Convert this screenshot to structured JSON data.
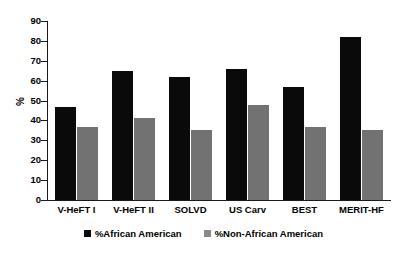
{
  "chart_data": {
    "type": "bar",
    "title": "",
    "subtitle": "",
    "xlabel": "",
    "ylabel": "%",
    "ylim": [
      0,
      90
    ],
    "ytick_step": 10,
    "yticks": [
      "90",
      "80",
      "70",
      "60",
      "50",
      "40",
      "30",
      "20",
      "10",
      "0"
    ],
    "grid": false,
    "legend_position": "bottom-center",
    "categories": [
      "V-HeFT I",
      "V-HeFT II",
      "SOLVD",
      "US Carv",
      "BEST",
      "MERIT-HF"
    ],
    "series": [
      {
        "name": "%African American",
        "color": "#0a0a0a",
        "values": [
          47,
          65,
          62,
          66,
          57,
          82
        ]
      },
      {
        "name": "%Non-African American",
        "color": "#727272",
        "values": [
          36.5,
          41,
          35,
          48,
          36.5,
          35
        ]
      }
    ]
  },
  "legend": {
    "items": [
      {
        "label": "%African American",
        "swatch": "black-square-icon"
      },
      {
        "label": "%Non-African American",
        "swatch": "gray-square-icon"
      }
    ]
  },
  "colors": {
    "series_black": "#0a0a0a",
    "series_gray": "#727272",
    "axis": "#1a1a1a",
    "background": "#ffffff"
  }
}
